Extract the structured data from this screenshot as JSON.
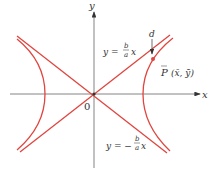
{
  "figure": {
    "axes": {
      "x_label": "x",
      "y_label": "y",
      "origin_label": "0"
    },
    "asymptotes": {
      "positive": {
        "prefix": "y =",
        "num": "b",
        "den": "a",
        "var": "x"
      },
      "negative": {
        "prefix": "y = −",
        "num": "b",
        "den": "a",
        "var": "x"
      }
    },
    "point": {
      "name": "P",
      "coords": "(x̄, ȳ)"
    },
    "distance_label": "d",
    "colors": {
      "curve": "#e0453f",
      "axis": "#555555",
      "text": "#333333"
    }
  }
}
